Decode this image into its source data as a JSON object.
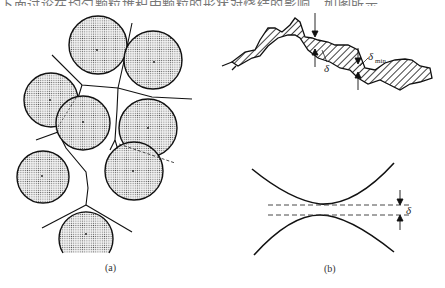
{
  "header": {
    "clipped_text": "下面讨论在均匀颗粒堆积中颗粒的形状对烧结的影响，如图所示"
  },
  "figure": {
    "panel_a": {
      "caption": "(a)",
      "description": "Packed spherical particles with Voronoi-like boundary lines between them",
      "particle_count": 7
    },
    "panel_b": {
      "caption": "(b)",
      "top_curve_label": "δ",
      "min_label_symbol": "δ",
      "min_label_subscript": "min",
      "gap_label": "δ"
    }
  },
  "colors": {
    "ink": "#111111",
    "dot_fill": "#c8c8c8"
  }
}
